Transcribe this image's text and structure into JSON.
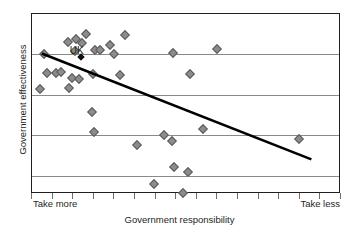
{
  "chart_data": {
    "type": "scatter",
    "title": "",
    "xlabel": "Government responsibility",
    "ylabel": "Government effectiveness",
    "xlim": [
      0,
      100
    ],
    "ylim": [
      0,
      100
    ],
    "grid": true,
    "gridlines_y": [
      77.8,
      55.0,
      32.8,
      10.0
    ],
    "xtick_labels": {
      "left": "Take more",
      "right": "Take less"
    },
    "xtick_count": 16,
    "legend": "none",
    "annotations": [
      {
        "text": "UK",
        "x": 14.5,
        "y": 80.0
      }
    ],
    "series": [
      {
        "name": "countries",
        "marker": "diamond",
        "color": "#8c8c8c",
        "points": [
          {
            "x": 3.9,
            "y": 77.8
          },
          {
            "x": 4.9,
            "y": 67.2
          },
          {
            "x": 2.6,
            "y": 58.3
          },
          {
            "x": 7.8,
            "y": 67.2
          },
          {
            "x": 9.4,
            "y": 67.8
          },
          {
            "x": 11.7,
            "y": 84.4
          },
          {
            "x": 14.2,
            "y": 86.1
          },
          {
            "x": 16.2,
            "y": 83.9
          },
          {
            "x": 17.5,
            "y": 88.9
          },
          {
            "x": 13.9,
            "y": 79.4
          },
          {
            "x": 13.0,
            "y": 64.4
          },
          {
            "x": 15.2,
            "y": 63.9
          },
          {
            "x": 12.0,
            "y": 58.9
          },
          {
            "x": 20.5,
            "y": 80.0
          },
          {
            "x": 22.0,
            "y": 80.0
          },
          {
            "x": 25.2,
            "y": 82.8
          },
          {
            "x": 19.8,
            "y": 66.7
          },
          {
            "x": 30.0,
            "y": 88.3
          },
          {
            "x": 26.5,
            "y": 77.8
          },
          {
            "x": 28.5,
            "y": 66.1
          },
          {
            "x": 19.5,
            "y": 45.6
          },
          {
            "x": 20.2,
            "y": 34.4
          },
          {
            "x": 45.5,
            "y": 78.3
          },
          {
            "x": 42.8,
            "y": 32.8
          },
          {
            "x": 45.2,
            "y": 29.4
          },
          {
            "x": 33.9,
            "y": 27.2
          },
          {
            "x": 45.8,
            "y": 15.0
          },
          {
            "x": 50.5,
            "y": 12.2
          },
          {
            "x": 39.5,
            "y": 5.6
          },
          {
            "x": 48.8,
            "y": 0.8
          },
          {
            "x": 51.0,
            "y": 66.7
          },
          {
            "x": 55.5,
            "y": 36.1
          },
          {
            "x": 60.0,
            "y": 80.6
          },
          {
            "x": 86.5,
            "y": 30.6
          }
        ]
      },
      {
        "name": "UK",
        "marker": "diamond",
        "color": "#111111",
        "points": [
          {
            "x": 16.0,
            "y": 76.1
          }
        ]
      }
    ],
    "trendline": {
      "type": "linear",
      "color": "#000000",
      "x_start": 3.2,
      "y_start": 77.8,
      "x_end": 91.0,
      "y_end": 18.3
    }
  }
}
